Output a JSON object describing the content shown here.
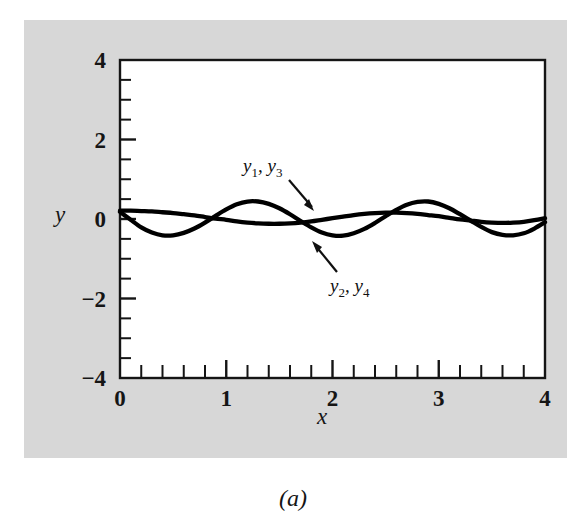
{
  "figure": {
    "caption": "(a)",
    "background_color": "#d7d7d7",
    "plot_background_color": "#ffffff",
    "line_color": "#000000"
  },
  "axes": {
    "x_label": "x",
    "y_label": "y",
    "x_ticks": [
      "0",
      "1",
      "2",
      "3",
      "4"
    ],
    "y_ticks": [
      "4",
      "2",
      "0",
      "−2",
      "−4"
    ]
  },
  "annotations": [
    {
      "name": "label-y1-y3",
      "text_a": "y",
      "sub_a": "1",
      "sep": ", ",
      "text_b": "y",
      "sub_b": "3"
    },
    {
      "name": "label-y2-y4",
      "text_a": "y",
      "sub_a": "2",
      "sep": ", ",
      "text_b": "y",
      "sub_b": "4"
    }
  ],
  "chart_data": {
    "type": "line",
    "title": "(a)",
    "xlabel": "x",
    "ylabel": "y",
    "xlim": [
      0,
      4
    ],
    "ylim": [
      -4,
      4
    ],
    "x_major_ticks": [
      0,
      1,
      2,
      3,
      4
    ],
    "x_minor_step": 0.2,
    "y_major_ticks": [
      -4,
      -2,
      0,
      2,
      4
    ],
    "y_minor_step": 0.5,
    "grid": false,
    "legend": "inline-annotations",
    "series": [
      {
        "name": "y1, y3",
        "label": "y₁, y₃",
        "description": "low-amplitude slowly varying wave",
        "x": [
          0,
          0.1,
          0.2,
          0.3,
          0.4,
          0.5,
          0.6,
          0.7,
          0.8,
          0.9,
          1.0,
          1.1,
          1.2,
          1.3,
          1.4,
          1.5,
          1.6,
          1.7,
          1.8,
          1.9,
          2.0,
          2.1,
          2.2,
          2.3,
          2.4,
          2.5,
          2.6,
          2.7,
          2.8,
          2.9,
          3.0,
          3.1,
          3.2,
          3.3,
          3.4,
          3.5,
          3.6,
          3.7,
          3.8,
          3.9,
          4.0
        ],
        "y": [
          0.21,
          0.21,
          0.2,
          0.19,
          0.17,
          0.15,
          0.12,
          0.09,
          0.05,
          0.01,
          -0.02,
          -0.06,
          -0.09,
          -0.11,
          -0.12,
          -0.12,
          -0.11,
          -0.09,
          -0.06,
          -0.02,
          0.02,
          0.06,
          0.1,
          0.13,
          0.15,
          0.16,
          0.16,
          0.15,
          0.13,
          0.1,
          0.07,
          0.03,
          -0.01,
          -0.04,
          -0.07,
          -0.09,
          -0.1,
          -0.09,
          -0.07,
          -0.03,
          0.02
        ]
      },
      {
        "name": "y2, y4",
        "label": "y₂, y₄",
        "description": "higher-amplitude wave, period approximately 1.55",
        "x": [
          0,
          0.1,
          0.2,
          0.3,
          0.4,
          0.5,
          0.6,
          0.7,
          0.8,
          0.9,
          1.0,
          1.1,
          1.2,
          1.3,
          1.4,
          1.5,
          1.6,
          1.7,
          1.8,
          1.9,
          2.0,
          2.1,
          2.2,
          2.3,
          2.4,
          2.5,
          2.6,
          2.7,
          2.8,
          2.9,
          3.0,
          3.1,
          3.2,
          3.3,
          3.4,
          3.5,
          3.6,
          3.7,
          3.8,
          3.9,
          4.0
        ],
        "y": [
          0.18,
          -0.02,
          -0.21,
          -0.34,
          -0.41,
          -0.41,
          -0.35,
          -0.24,
          -0.09,
          0.08,
          0.24,
          0.37,
          0.44,
          0.44,
          0.38,
          0.27,
          0.12,
          -0.05,
          -0.21,
          -0.34,
          -0.41,
          -0.42,
          -0.36,
          -0.25,
          -0.1,
          0.07,
          0.23,
          0.36,
          0.43,
          0.44,
          0.38,
          0.27,
          0.12,
          -0.04,
          -0.2,
          -0.33,
          -0.4,
          -0.41,
          -0.36,
          -0.24,
          -0.08
        ]
      }
    ]
  }
}
